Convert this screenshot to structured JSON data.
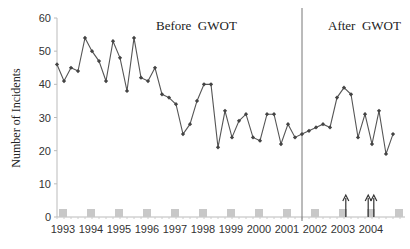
{
  "chart_data": {
    "type": "line",
    "title": "",
    "xlabel": "",
    "ylabel": "Number of Incidents",
    "ylim": [
      0,
      60
    ],
    "yticks": [
      0,
      10,
      20,
      30,
      40,
      50,
      60
    ],
    "xtick_labels": [
      "1993",
      "1994",
      "1995",
      "1996",
      "1997",
      "1998",
      "1999",
      "2000",
      "2001",
      "2002",
      "2003",
      "2004"
    ],
    "grid": false,
    "annotations": [
      {
        "text": "Before  GWOT",
        "position": "upper-middle-left"
      },
      {
        "text": "After  GWOT",
        "position": "upper-right"
      }
    ],
    "divider_label": "GWOT start (late 2001)",
    "series": [
      {
        "name": "Incidents (quarterly)",
        "marker": "diamond",
        "color": "#555555",
        "values": [
          46,
          41,
          45,
          44,
          54,
          50,
          47,
          41,
          53,
          48,
          38,
          54,
          42,
          41,
          45,
          37,
          36,
          34,
          25,
          28,
          35,
          40,
          40,
          21,
          32,
          24,
          29,
          31,
          24,
          23,
          31,
          31,
          22,
          28,
          24,
          25,
          26,
          27,
          28,
          27,
          36,
          39,
          37,
          24,
          31,
          22,
          32,
          19,
          25
        ]
      },
      {
        "name": "Yearly baseline markers",
        "marker": "square",
        "color": "#c8c8c8",
        "values": [
          1,
          1,
          1,
          1,
          1,
          1,
          1,
          1,
          1,
          1,
          1,
          1,
          1
        ]
      }
    ],
    "event_arrows": [
      {
        "x_year": 2003.1
      },
      {
        "x_year": 2003.9
      },
      {
        "x_year": 2004.1
      }
    ]
  },
  "labels": {
    "ylabel": "Number of Incidents",
    "before": "Before  GWOT",
    "after": "After  GWOT"
  }
}
